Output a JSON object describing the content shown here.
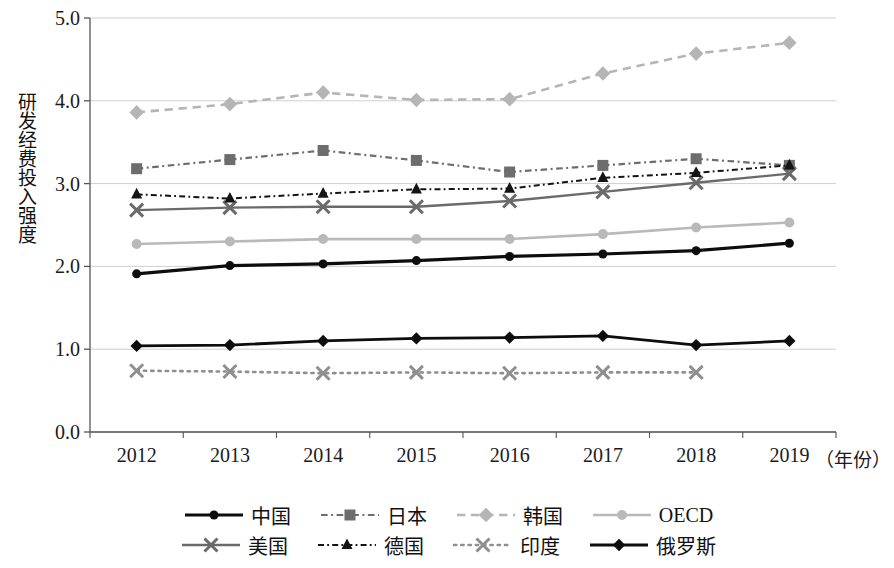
{
  "chart_data": {
    "type": "line",
    "title": "",
    "xlabel": "年份",
    "ylabel": "研发经费投入强度",
    "x": [
      "2012",
      "2013",
      "2014",
      "2015",
      "2016",
      "2017",
      "2018",
      "2019"
    ],
    "xlabel_suffix": "（年份）",
    "ylim": [
      0.0,
      5.0
    ],
    "ytick_labels": [
      "0.0",
      "1.0",
      "2.0",
      "3.0",
      "4.0",
      "5.0"
    ],
    "ytick_values": [
      0.0,
      1.0,
      2.0,
      3.0,
      4.0,
      5.0
    ],
    "grid": true,
    "legend_position": "bottom",
    "series": [
      {
        "name": "中国",
        "marker": "circle",
        "line_style": "solid",
        "color": "#0d0d0d",
        "line_width": 3.2,
        "marker_size": 9,
        "values": [
          1.91,
          2.01,
          2.03,
          2.07,
          2.12,
          2.15,
          2.19,
          2.28
        ]
      },
      {
        "name": "日本",
        "marker": "square",
        "line_style": "dashdot",
        "color": "#6d6d6d",
        "line_width": 2.2,
        "marker_size": 11,
        "values": [
          3.18,
          3.29,
          3.4,
          3.28,
          3.14,
          3.22,
          3.3,
          3.22
        ]
      },
      {
        "name": "韩国",
        "marker": "diamond",
        "line_style": "dashed",
        "color": "#b5b5b5",
        "line_width": 2.6,
        "marker_size": 13,
        "values": [
          3.86,
          3.96,
          4.1,
          4.01,
          4.02,
          4.33,
          4.57,
          4.7
        ]
      },
      {
        "name": "OECD",
        "marker": "circle",
        "line_style": "solid",
        "color": "#b9b9b9",
        "line_width": 2.6,
        "marker_size": 10,
        "values": [
          2.27,
          2.3,
          2.33,
          2.33,
          2.33,
          2.39,
          2.47,
          2.53
        ]
      },
      {
        "name": "美国",
        "marker": "x",
        "line_style": "solid",
        "color": "#6a6a6a",
        "line_width": 2.4,
        "marker_size": 13,
        "values": [
          2.68,
          2.71,
          2.72,
          2.72,
          2.79,
          2.9,
          3.01,
          3.12
        ]
      },
      {
        "name": "德国",
        "marker": "triangle",
        "line_style": "dashdot",
        "color": "#141414",
        "line_width": 2.0,
        "marker_size": 11,
        "values": [
          2.87,
          2.82,
          2.88,
          2.93,
          2.94,
          3.07,
          3.13,
          3.22
        ]
      },
      {
        "name": "印度",
        "marker": "x",
        "line_style": "dotted",
        "color": "#8f8f8f",
        "line_width": 2.6,
        "marker_size": 13,
        "values": [
          0.74,
          0.73,
          0.71,
          0.72,
          0.71,
          0.72,
          0.72,
          null
        ]
      },
      {
        "name": "俄罗斯",
        "marker": "diamond",
        "line_style": "solid",
        "color": "#0d0d0d",
        "line_width": 2.8,
        "marker_size": 11,
        "values": [
          1.04,
          1.05,
          1.1,
          1.13,
          1.14,
          1.16,
          1.05,
          1.1
        ]
      }
    ]
  },
  "legend": {
    "rows": [
      [
        "中国",
        "日本",
        "韩国",
        "OECD"
      ],
      [
        "美国",
        "德国",
        "印度",
        "俄罗斯"
      ]
    ]
  },
  "colors": {
    "axis": "#555555",
    "grid": "#cfcfcf",
    "text": "#1a1a1a",
    "background": "#ffffff"
  }
}
